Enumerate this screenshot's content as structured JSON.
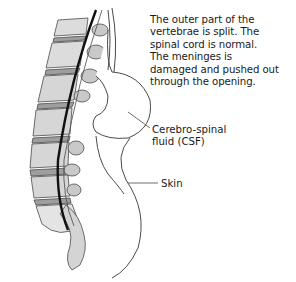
{
  "figure": {
    "description_lines": [
      "The outer part of the",
      "vertebrae is split. The",
      "spinal cord is normal.",
      "The meninges is",
      "damaged and pushed out",
      "through the opening."
    ],
    "labels": {
      "csf": [
        "Cerebro-spinal",
        "fluid (CSF)"
      ],
      "skin": "Skin"
    },
    "colors": {
      "outline": "#4a4a4a",
      "vertebra_fill": "#d9d9d9",
      "vertebra_shade": "#b8b8b8",
      "disc_fill": "#9e9e9e",
      "spinal_cord": "#111111",
      "text": "#1a1a1a"
    }
  }
}
